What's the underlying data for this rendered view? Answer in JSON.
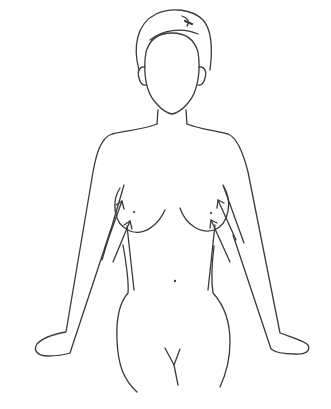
{
  "figure": {
    "colors": {
      "background": "#ffffff",
      "line": "#3a3a3a"
    },
    "arrows": {
      "left_count": 2,
      "right_count": 2,
      "direction": "up-inward"
    }
  }
}
